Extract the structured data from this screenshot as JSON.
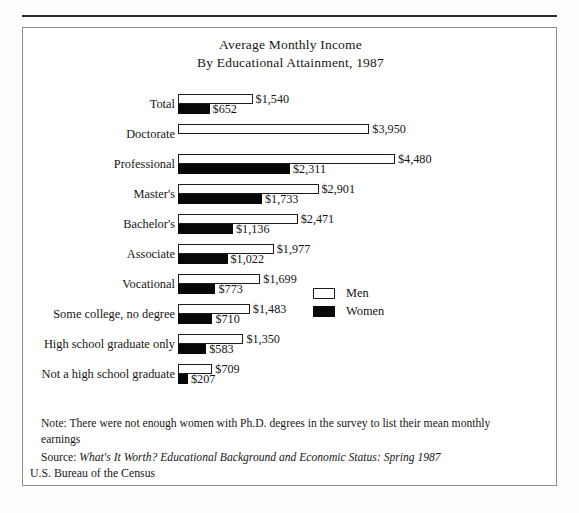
{
  "figure": {
    "title_line_1": "Average Monthly Income",
    "title_line_2": "By Educational Attainment, 1987",
    "note": "Note: There were not enough women with Ph.D. degrees in the survey to list their mean monthly earnings",
    "source_label": "Source: ",
    "source_title": "What's It Worth? Educational Background and Economic Status: Spring 1987",
    "attribution": "U.S. Bureau of the Census"
  },
  "legend": {
    "position": "inside-right",
    "items": [
      {
        "label": "Men",
        "swatch": "white-outlined-square",
        "color": "#ffffff"
      },
      {
        "label": "Women",
        "swatch": "black-filled-square",
        "color": "#080808"
      }
    ]
  },
  "chart_data": {
    "type": "bar",
    "orientation": "horizontal",
    "title": "Average Monthly Income By Educational Attainment, 1987",
    "xlabel": "",
    "ylabel": "",
    "grid": false,
    "legend_position": "inside-right",
    "xlim": [
      0,
      4480
    ],
    "categories": [
      "Total",
      "Doctorate",
      "Professional",
      "Master's",
      "Bachelor's",
      "Associate",
      "Vocational",
      "Some college, no degree",
      "High school graduate only",
      "Not a high school graduate"
    ],
    "series": [
      {
        "name": "Men",
        "color": "#ffffff",
        "values": [
          1540,
          3950,
          4480,
          2901,
          2471,
          1977,
          1699,
          1483,
          1350,
          709
        ],
        "labels": [
          "$1,540",
          "$3,950",
          "$4,480",
          "$2,901",
          "$2,471",
          "$1,977",
          "$1,699",
          "$1,483",
          "$1,350",
          "$709"
        ]
      },
      {
        "name": "Women",
        "color": "#080808",
        "values": [
          652,
          null,
          2311,
          1733,
          1136,
          1022,
          773,
          710,
          583,
          207
        ],
        "labels": [
          "$652",
          "",
          "$2,311",
          "$1,733",
          "$1,136",
          "$1,022",
          "$773",
          "$710",
          "$583",
          "$207"
        ]
      }
    ]
  }
}
